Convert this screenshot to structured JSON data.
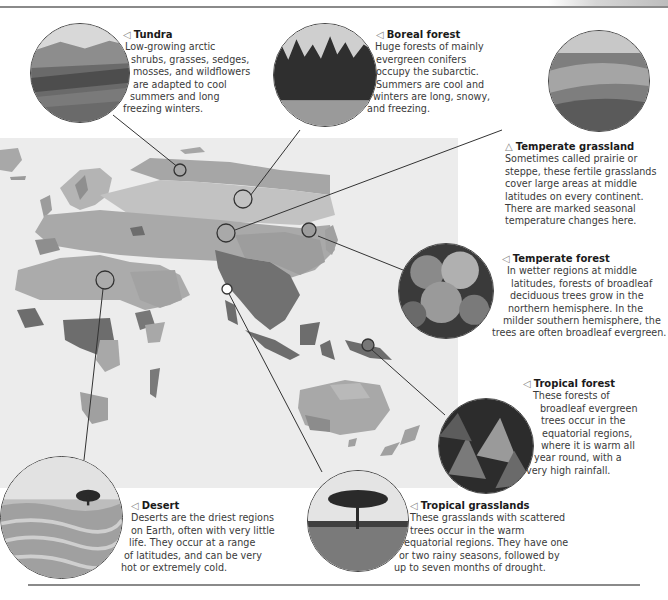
{
  "header": {
    "section_label": "BIOMES",
    "page_number": "33"
  },
  "colors": {
    "map_background": "#ececec",
    "tundra": "#a8a8a8",
    "boreal": "#bdbdbd",
    "temperate_grassland": "#a3a3a3",
    "temperate_forest": "#8c8c8c",
    "desert": "#a9a9a9",
    "tropical_forest": "#6e6e6e",
    "tropical_grassland": "#b0b0b0",
    "leader_line": "#333333"
  },
  "biomes": [
    {
      "id": "tundra",
      "arrow": "◁",
      "title": "Tundra",
      "lines": [
        "Low-growing arctic",
        "shrubs, grasses, sedges,",
        "mosses, and wildflowers",
        "are adapted to cool",
        "summers and long",
        "freezing winters."
      ]
    },
    {
      "id": "boreal-forest",
      "arrow": "◁",
      "title": "Boreal forest",
      "lines": [
        "Huge forests of mainly",
        "evergreen conifers",
        "occupy the subarctic.",
        "Summers are cool and",
        "winters are long, snowy,",
        "and freezing."
      ]
    },
    {
      "id": "temperate-grassland",
      "arrow": "△",
      "title": "Temperate grassland",
      "lines": [
        "Sometimes called prairie or",
        "steppe, these fertile grasslands",
        "cover large areas at middle",
        "latitudes on every continent.",
        "There are marked seasonal",
        "temperature changes here."
      ]
    },
    {
      "id": "temperate-forest",
      "arrow": "◁",
      "title": "Temperate forest",
      "lines": [
        "In wetter regions at middle",
        "latitudes, forests of broadleaf",
        "deciduous trees grow in the",
        "northern hemisphere. In the",
        "milder southern hemisphere, the",
        "trees are often broadleaf evergreen."
      ]
    },
    {
      "id": "tropical-forest",
      "arrow": "◁",
      "title": "Tropical forest",
      "lines": [
        "These forests of",
        "broadleaf evergreen",
        "trees occur in the",
        "equatorial regions,",
        "where it is warm all",
        "year round, with a",
        "very high rainfall."
      ]
    },
    {
      "id": "desert",
      "arrow": "◁",
      "title": "Desert",
      "lines": [
        "Deserts are the driest regions",
        "on Earth, often with very little",
        "life. They occur at a range",
        "of latitudes, and can be very",
        "hot or extremely cold."
      ]
    },
    {
      "id": "tropical-grasslands",
      "arrow": "◁",
      "title": "Tropical grasslands",
      "lines": [
        "These grasslands with scattered",
        "trees occur in the warm",
        "equatorial regions. They have one",
        "or two rainy seasons, followed by",
        "up to seven months of drought."
      ]
    }
  ]
}
